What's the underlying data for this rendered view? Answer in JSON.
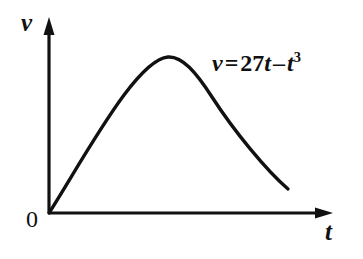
{
  "figure": {
    "background_color": "#ffffff",
    "ink_color": "#111111",
    "width": 363,
    "height": 259
  },
  "axes": {
    "vertical": {
      "label": "v",
      "x": 49,
      "top_y": 20,
      "bottom_y": 213,
      "arrow": "up-arrow"
    },
    "horizontal": {
      "label": "t",
      "y": 213,
      "left_x": 49,
      "right_x": 332,
      "arrow": "right-arrow"
    },
    "origin_label": "0"
  },
  "equation": {
    "full_text": "v = 27t - t^3",
    "lhs": "v",
    "equals": "=",
    "coefficient": "27",
    "linear_var": "t",
    "minus": "–",
    "cubic_var": "t",
    "exponent": "3"
  },
  "chart_data": {
    "type": "line",
    "title": "",
    "subtitle": "",
    "xlabel": "t",
    "ylabel": "v",
    "annotations": [
      {
        "text": "v = 27t – t³",
        "x": 212,
        "y": 50
      },
      {
        "text": "0",
        "x": 26,
        "y": 207
      }
    ],
    "legend": [],
    "legend_position": "none",
    "grid": false,
    "axis_arrows": true,
    "xlim": [
      0,
      5.3
    ],
    "ylim": [
      0,
      62
    ],
    "function": "v = 27t - t^3",
    "peak": {
      "t": 3,
      "v": 54
    },
    "x": [
      0,
      0.25,
      0.5,
      0.75,
      1,
      1.25,
      1.5,
      1.75,
      2,
      2.25,
      2.5,
      2.75,
      3,
      3.25,
      3.5,
      3.75,
      4,
      4.25,
      4.5,
      4.75,
      5,
      5.2
    ],
    "y": [
      0,
      6.73,
      13.38,
      19.83,
      26,
      31.8,
      37.13,
      41.89,
      46,
      49.36,
      51.88,
      53.46,
      54,
      53.41,
      51.63,
      48.8,
      44,
      36.92,
      30.38,
      14.17,
      10,
      4.6
    ],
    "series": [
      {
        "name": "v = 27t – t³",
        "values": [
          0,
          6.73,
          13.38,
          19.83,
          26,
          31.8,
          37.13,
          41.89,
          46,
          49.36,
          51.88,
          53.46,
          54,
          53.41,
          51.63,
          48.8,
          44,
          36.92,
          30.38,
          14.17,
          10,
          4.6
        ],
        "color": "#111111"
      }
    ],
    "curve_pixel_path": "M 49,213 C 70,180 98,130 124,95 C 142,71 156,58 168,57 C 182,56 196,72 212,97 C 234,131 266,170 288,189"
  }
}
